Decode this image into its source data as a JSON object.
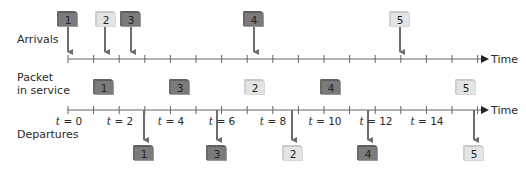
{
  "labels": {
    "arrivals": "Arrivals",
    "service_line1": "Packet",
    "service_line2": "in service",
    "departures": "Departures",
    "time_top": "Time",
    "time_bottom": "Time"
  },
  "time_ticks": [
    {
      "var": "t",
      "text": " = 0"
    },
    {
      "var": "t",
      "text": " = 2"
    },
    {
      "var": "t",
      "text": " = 4"
    },
    {
      "var": "t",
      "text": " = 6"
    },
    {
      "var": "t",
      "text": " = 8"
    },
    {
      "var": "t",
      "text": " = 10"
    },
    {
      "var": "t",
      "text": " = 12"
    },
    {
      "var": "t",
      "text": " = 14"
    }
  ],
  "arrivals": [
    {
      "packet": "1",
      "shade": "dark"
    },
    {
      "packet": "2",
      "shade": "light"
    },
    {
      "packet": "3",
      "shade": "dark"
    },
    {
      "packet": "4",
      "shade": "dark"
    },
    {
      "packet": "5",
      "shade": "light"
    }
  ],
  "service": [
    {
      "packet": "1",
      "shade": "dark"
    },
    {
      "packet": "3",
      "shade": "dark"
    },
    {
      "packet": "2",
      "shade": "light"
    },
    {
      "packet": "4",
      "shade": "dark"
    },
    {
      "packet": "5",
      "shade": "light"
    }
  ],
  "departures": [
    {
      "packet": "1",
      "shade": "dark"
    },
    {
      "packet": "3",
      "shade": "dark"
    },
    {
      "packet": "2",
      "shade": "light"
    },
    {
      "packet": "4",
      "shade": "dark"
    },
    {
      "packet": "5",
      "shade": "light"
    }
  ],
  "colors": {
    "dark_box": "#7b7b7b",
    "light_box": "#e4e4e4",
    "axis": "#555555",
    "arrow": "#6e6e6e"
  }
}
